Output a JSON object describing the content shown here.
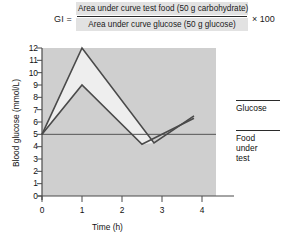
{
  "formula": {
    "gi_label": "GI =",
    "numerator": "Area under curve test food (50 g carbohydrate)",
    "denominator": "Area under curve glucose (50 g glucose)",
    "multiplier": "× 100"
  },
  "legend": {
    "glucose_label": "Glucose",
    "food_label_line1": "Food",
    "food_label_line2": "under",
    "food_label_line3": "test"
  },
  "colors": {
    "plot_background": "#cfcfcf",
    "area_fill": "#eeeeee",
    "curve": "#4a4a4a",
    "axis": "#4a4a4a",
    "formula_band": "#e2e2e2",
    "text": "#1a1a1a"
  },
  "chart_data": {
    "type": "line",
    "title": "",
    "xlabel": "Time (h)",
    "ylabel": "Blood glucose (mmol/L)",
    "xlim": [
      0,
      4.35
    ],
    "ylim": [
      0,
      12
    ],
    "xticks": [
      0,
      1,
      2,
      3,
      4
    ],
    "xtick_labels": [
      "0",
      "1",
      "2",
      "3",
      "4"
    ],
    "yticks": [
      0,
      1,
      2,
      3,
      4,
      5,
      6,
      7,
      8,
      9,
      10,
      11,
      12
    ],
    "ytick_labels": [
      "0",
      "1",
      "2",
      "3",
      "4",
      "5",
      "6",
      "7",
      "8",
      "9",
      "10",
      "11",
      "12"
    ],
    "grid": false,
    "legend_position": "right",
    "baseline": 5,
    "series": [
      {
        "name": "Glucose",
        "x": [
          0,
          1,
          2.8,
          3.8
        ],
        "values": [
          5,
          12,
          4.3,
          6.5
        ]
      },
      {
        "name": "Food under test",
        "x": [
          0,
          1,
          2.5,
          3.8
        ],
        "values": [
          5,
          9,
          4.2,
          6.3
        ]
      }
    ]
  }
}
